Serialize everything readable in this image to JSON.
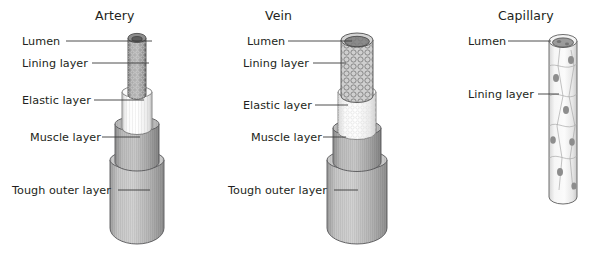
{
  "diagram": {
    "title_semantic": "blood-vessel-structure-comparison",
    "background_color": "#ffffff",
    "text_color": "#231f20",
    "leader_line_color": "#3b3b3b"
  },
  "panels": [
    {
      "id": "artery",
      "title": "Artery",
      "title_x": 95,
      "title_y": 8,
      "labels": [
        {
          "name": "lumen",
          "text": "Lumen",
          "x": 22,
          "y": 35,
          "line_x1": 66,
          "line_x2": 152,
          "line_y": 41
        },
        {
          "name": "lining",
          "text": "Lining layer",
          "x": 22,
          "y": 57,
          "line_x1": 92,
          "line_x2": 149,
          "line_y": 63
        },
        {
          "name": "elastic",
          "text": "Elastic layer",
          "x": 22,
          "y": 94,
          "line_x1": 94,
          "line_x2": 144,
          "line_y": 100
        },
        {
          "name": "muscle",
          "text": "Muscle layer",
          "x": 30,
          "y": 131,
          "line_x1": 102,
          "line_x2": 140,
          "line_y": 137
        },
        {
          "name": "tough-outer",
          "text": "Tough outer layer",
          "x": 12,
          "y": 184,
          "line_x1": 118,
          "line_x2": 150,
          "line_y": 190
        }
      ]
    },
    {
      "id": "vein",
      "title": "Vein",
      "title_x": 265,
      "title_y": 8,
      "labels": [
        {
          "name": "lumen",
          "text": "Lumen",
          "x": 247,
          "y": 35,
          "line_x1": 288,
          "line_x2": 352,
          "line_y": 41
        },
        {
          "name": "lining",
          "text": "Lining layer",
          "x": 243,
          "y": 57,
          "line_x1": 313,
          "line_x2": 346,
          "line_y": 63
        },
        {
          "name": "elastic",
          "text": "Elastic layer",
          "x": 243,
          "y": 99,
          "line_x1": 315,
          "line_x2": 348,
          "line_y": 105
        },
        {
          "name": "muscle",
          "text": "Muscle layer",
          "x": 251,
          "y": 131,
          "line_x1": 323,
          "line_x2": 346,
          "line_y": 137
        },
        {
          "name": "tough-outer",
          "text": "Tough outer layer",
          "x": 228,
          "y": 184,
          "line_x1": 334,
          "line_x2": 358,
          "line_y": 190
        }
      ]
    },
    {
      "id": "capillary",
      "title": "Capillary",
      "title_x": 498,
      "title_y": 8,
      "labels": [
        {
          "name": "lumen",
          "text": "Lumen",
          "x": 468,
          "y": 35,
          "line_x1": 508,
          "line_x2": 551,
          "line_y": 41
        },
        {
          "name": "lining",
          "text": "Lining layer",
          "x": 468,
          "y": 88,
          "line_x1": 538,
          "line_x2": 559,
          "line_y": 94
        }
      ]
    }
  ],
  "vessel_colors": {
    "lumen_dark": "#6e6e6e",
    "lining": "#9a9a9a",
    "elastic": "#f1f1f1",
    "muscle": "#b4b4b4",
    "outer": "#bdbdbd",
    "outline": "#58585a",
    "capillary_fill": "#efefef",
    "capillary_nucleus": "#8d8d8d"
  }
}
